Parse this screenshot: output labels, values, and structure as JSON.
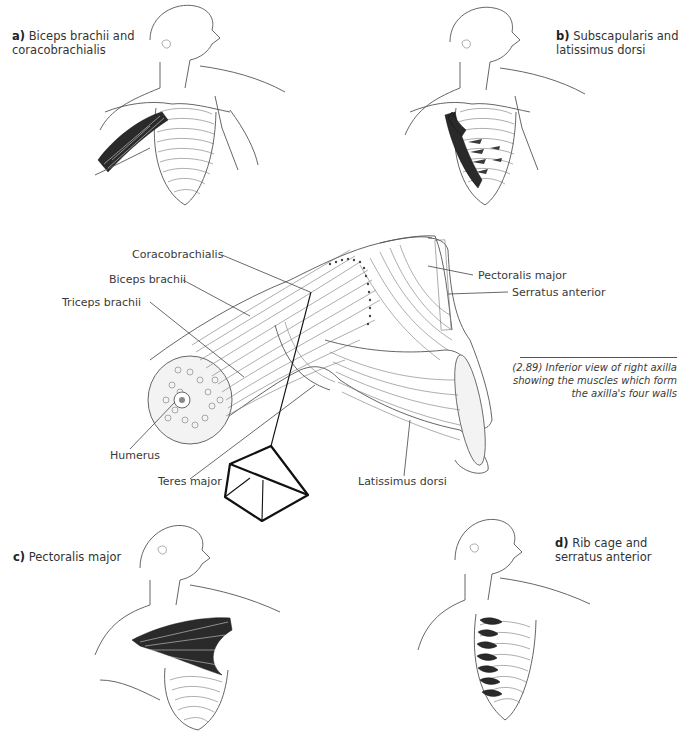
{
  "figure": {
    "caption": "(2.89) Inferior view of right axilla showing the muscles which form the axilla's four walls",
    "caption_lines": [
      "(2.89) Inferior view of right axilla",
      "showing the muscles which form",
      "the axilla's four walls"
    ]
  },
  "panels": [
    {
      "letter": "a)",
      "line1": "Biceps brachii and",
      "line2": "coracobrachialis"
    },
    {
      "letter": "b)",
      "line1": "Subscapularis and",
      "line2": "latissimus dorsi"
    },
    {
      "letter": "c)",
      "line1": "Pectoralis major",
      "line2": ""
    },
    {
      "letter": "d)",
      "line1": "Rib cage and",
      "line2": "serratus anterior"
    }
  ],
  "central_labels": {
    "coracobrachialis": "Coracobrachialis",
    "biceps_brachii": "Biceps brachii",
    "triceps_brachii": "Triceps brachii",
    "humerus": "Humerus",
    "teres_major": "Teres major",
    "latissimus_dorsi": "Latissimus dorsi",
    "pectoralis_major": "Pectoralis major",
    "serratus_anterior": "Serratus anterior"
  }
}
